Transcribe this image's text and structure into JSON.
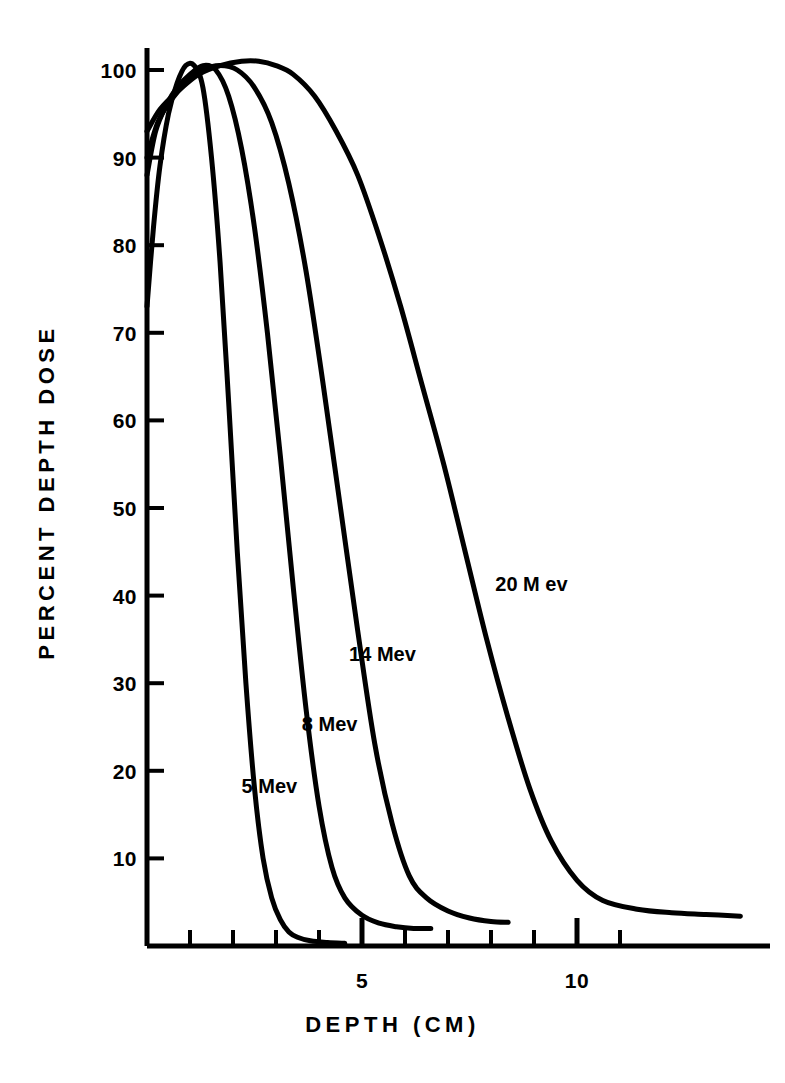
{
  "figure": {
    "x_axis_title": "DEPTH  (CM)",
    "y_axis_title": "PERCENT DEPTH DOSE",
    "background_color": "#ffffff",
    "line_color": "#000000"
  },
  "chart_data": {
    "type": "line",
    "title": "",
    "subtitle": "",
    "xlabel": "DEPTH  (CM)",
    "ylabel": "PERCENT DEPTH DOSE",
    "xlim": [
      0,
      14
    ],
    "ylim": [
      0,
      105
    ],
    "grid": false,
    "legend": "inline-curve-labels",
    "x_ticks_major": [
      5,
      10
    ],
    "x_tick_labels_major": [
      "5",
      "10"
    ],
    "x_ticks_minor": [
      1,
      2,
      3,
      4,
      6,
      7,
      8,
      9,
      11
    ],
    "y_ticks": [
      10,
      20,
      30,
      40,
      50,
      60,
      70,
      80,
      90,
      100
    ],
    "y_tick_labels": [
      "10",
      "20",
      "30",
      "40",
      "50",
      "60",
      "70",
      "80",
      "90",
      "100"
    ],
    "series": [
      {
        "name": "5 Mev",
        "label": "5 Mev",
        "label_x": 2.2,
        "label_y": 17.5,
        "x": [
          0.0,
          0.15,
          0.3,
          0.5,
          0.7,
          0.9,
          1.1,
          1.3,
          1.5,
          1.7,
          1.9,
          2.1,
          2.3,
          2.5,
          2.7,
          2.9,
          3.1,
          3.3,
          3.5,
          3.8,
          4.2,
          4.6
        ],
        "y": [
          73,
          82,
          89,
          95,
          98.5,
          100.5,
          100.5,
          98,
          90,
          78,
          62,
          45,
          30,
          18,
          10,
          5.5,
          3,
          1.6,
          1.0,
          0.6,
          0.4,
          0.3
        ]
      },
      {
        "name": "8 Mev",
        "label": "8 Mev",
        "label_x": 3.6,
        "label_y": 24.5,
        "x": [
          0.0,
          0.2,
          0.45,
          0.7,
          1.0,
          1.3,
          1.6,
          1.9,
          2.2,
          2.5,
          2.8,
          3.1,
          3.4,
          3.7,
          4.0,
          4.3,
          4.6,
          5.0,
          5.4,
          5.8,
          6.2,
          6.6
        ],
        "y": [
          88,
          93,
          96,
          98,
          99.5,
          100.5,
          100,
          97,
          91,
          82,
          70,
          56,
          41,
          27,
          16,
          9,
          5.5,
          3.5,
          2.6,
          2.2,
          2.0,
          2.0
        ]
      },
      {
        "name": "14 Mev",
        "label": "14 Mev",
        "label_x": 4.7,
        "label_y": 32.5,
        "x": [
          0.0,
          0.25,
          0.55,
          0.9,
          1.3,
          1.7,
          2.1,
          2.5,
          2.9,
          3.3,
          3.7,
          4.1,
          4.5,
          4.9,
          5.3,
          5.7,
          6.1,
          6.5,
          7.0,
          7.5,
          8.0,
          8.4
        ],
        "y": [
          90,
          94,
          96.5,
          98.5,
          100,
          100.5,
          100,
          98,
          94,
          87,
          77,
          64,
          50,
          36,
          23,
          14,
          8,
          5.5,
          4.0,
          3.2,
          2.8,
          2.7
        ]
      },
      {
        "name": "20 M ev",
        "label": "20 M ev",
        "label_x": 8.1,
        "label_y": 40.5,
        "x": [
          0.0,
          0.3,
          0.7,
          1.2,
          1.7,
          2.2,
          2.6,
          3.0,
          3.4,
          3.9,
          4.4,
          4.9,
          5.4,
          5.9,
          6.4,
          6.9,
          7.4,
          7.9,
          8.4,
          8.9,
          9.4,
          10.0,
          10.6,
          11.4,
          12.2,
          13.0,
          13.8
        ],
        "y": [
          93,
          95.5,
          97.5,
          99.5,
          100.5,
          101,
          101,
          100.5,
          99.5,
          97,
          93,
          88,
          81,
          73,
          64,
          55,
          45,
          35,
          26,
          18,
          12,
          7.5,
          5.2,
          4.2,
          3.8,
          3.6,
          3.4
        ]
      }
    ]
  }
}
